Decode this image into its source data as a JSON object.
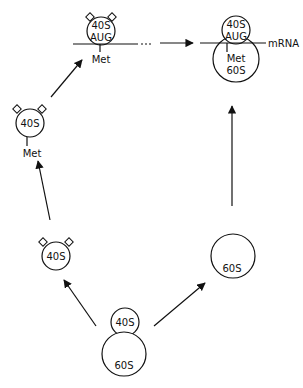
{
  "diagram": {
    "type": "ribosome-cycle",
    "nodes": {
      "dissociating": {
        "small": "40S",
        "large": "60S"
      },
      "free_40s": {
        "label": "40S"
      },
      "free_60s": {
        "label": "60S"
      },
      "met_40s": {
        "label": "40S",
        "ligand": "Met"
      },
      "scanning_40s": {
        "label": "40S",
        "codon": "AUG",
        "ligand": "Met"
      },
      "complex_80s": {
        "small": "40S",
        "codon": "AUG",
        "ligand": "Met",
        "large": "60S",
        "strand": "mRNA"
      }
    },
    "edges": [
      {
        "from": "dissociating",
        "to": "free_40s"
      },
      {
        "from": "dissociating",
        "to": "free_60s"
      },
      {
        "from": "free_40s",
        "to": "met_40s"
      },
      {
        "from": "met_40s",
        "to": "scanning_40s"
      },
      {
        "from": "scanning_40s",
        "to": "complex_80s"
      },
      {
        "from": "free_60s",
        "to": "complex_80s"
      }
    ],
    "colors": {
      "ink": "#111111",
      "paper": "#ffffff"
    }
  }
}
